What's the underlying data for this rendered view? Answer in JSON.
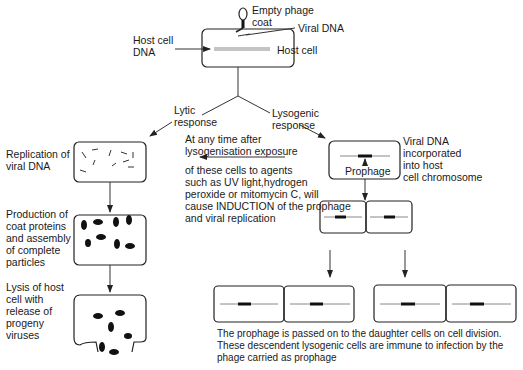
{
  "diagram": {
    "top": {
      "empty_phage_coat": [
        "Empty phage",
        "coat"
      ],
      "viral_dna": "Viral DNA",
      "host_cell": "Host cell",
      "host_cell_dna": [
        "Host cell",
        "DNA"
      ]
    },
    "branches": {
      "lytic": [
        "Lytic",
        "response"
      ],
      "lysogenic": [
        "Lysogenic",
        "response"
      ]
    },
    "lytic_steps": [
      {
        "label": [
          "Replication of",
          "viral DNA"
        ]
      },
      {
        "label": [
          "Production of",
          "coat proteins",
          "and assembly",
          "of complete",
          "particles"
        ]
      },
      {
        "label": [
          "Lysis of host",
          "cell with",
          "release of",
          "progeny",
          "viruses"
        ]
      }
    ],
    "induction_note": {
      "header": [
        "At any time after",
        "lysogenisation exposure"
      ],
      "body": [
        "of these cells to agents",
        "such as UV light,hydrogen",
        "peroxide or mitomycin C, will",
        "cause INDUCTION of the prophage",
        "and viral replication"
      ]
    },
    "lysogenic": {
      "prophage_label": "Prophage",
      "incorporated_note": [
        "Viral DNA",
        "incorporated",
        "into host",
        "cell chromosome"
      ]
    },
    "caption": [
      "The prophage is passed on to the daughter cells on cell division.",
      "These descendent lysogenic cells are immune to infection by the",
      "phage carried as prophage"
    ]
  }
}
